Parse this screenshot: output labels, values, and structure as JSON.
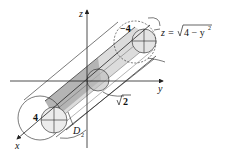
{
  "diagram": {
    "axes": {
      "x": "x",
      "y": "y",
      "z": "z"
    },
    "labels": {
      "surface_eq_lhs": "z =",
      "surface_eq_rad": "4 − y",
      "surface_eq_exp": "2",
      "radius_big_back": "−4",
      "radius_big_front": "4",
      "radius_small": "2",
      "region_D": "D",
      "region_D_sub": "2"
    },
    "colors": {
      "line": "#222222",
      "shade_light": "#e2e2e2",
      "shade_mid": "#c8c8c8",
      "shade_dark": "#a8a8a8"
    }
  }
}
